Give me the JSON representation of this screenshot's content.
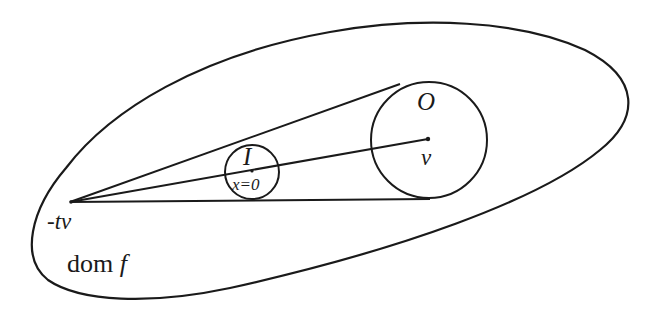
{
  "diagram": {
    "type": "geometric-illustration",
    "stroke_color": "#1a1a1a",
    "background": "#ffffff",
    "labels": {
      "outer_region": "dom f",
      "outer_region_main": "dom",
      "outer_region_var": "f",
      "apex_point": "-tv",
      "small_ellipsoid": "I",
      "small_ellipsoid_center": "x=0",
      "large_ellipsoid": "O",
      "large_ellipsoid_center": "v"
    },
    "elements": [
      {
        "id": "domain-boundary",
        "shape": "closed-curve",
        "label": "dom f"
      },
      {
        "id": "inner-circle",
        "shape": "circle",
        "label": "I",
        "center_label": "x=0"
      },
      {
        "id": "outer-circle",
        "shape": "circle",
        "label": "O",
        "center_label": "v"
      },
      {
        "id": "apex",
        "shape": "point",
        "label": "-tv"
      },
      {
        "id": "upper-tangent",
        "shape": "line",
        "from": "-tv",
        "to": "O top tangent"
      },
      {
        "id": "lower-tangent",
        "shape": "line",
        "from": "-tv",
        "to": "O bottom tangent"
      },
      {
        "id": "center-ray",
        "shape": "line",
        "from": "-tv",
        "to": "v"
      }
    ]
  }
}
